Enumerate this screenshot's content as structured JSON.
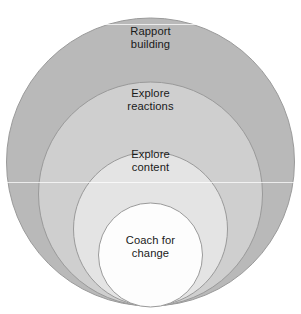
{
  "figure": {
    "kind": "nested-circles-diagram",
    "background_color": "#ffffff",
    "width": 301,
    "height": 314,
    "label_color": "#1a1a1a",
    "stroke_color": "#9a9a9a"
  },
  "circles": [
    {
      "id": "rapport-building",
      "label": "Rapport\nbuilding",
      "label_line1": "Rapport",
      "label_line2": "building",
      "level": 1,
      "fill": "#b9b9b9",
      "stroke": "#9a9a9a",
      "cx": 150.5,
      "cy": 162,
      "r": 144
    },
    {
      "id": "explore-reactions",
      "label": "Explore\nreactions",
      "label_line1": "Explore",
      "label_line2": "reactions",
      "level": 2,
      "fill": "#cfcfcf",
      "stroke": "#9a9a9a",
      "cx": 150.5,
      "cy": 194,
      "r": 112
    },
    {
      "id": "explore-content",
      "label": "Explore\ncontent",
      "label_line1": "Explore",
      "label_line2": "content",
      "level": 3,
      "fill": "#e4e4e4",
      "stroke": "#9a9a9a",
      "cx": 150.5,
      "cy": 229,
      "r": 77
    },
    {
      "id": "coach-for-change",
      "label": "Coach for\nchange",
      "label_line1": "Coach for",
      "label_line2": "change",
      "level": 4,
      "fill": "#fdfdfd",
      "stroke": "#9a9a9a",
      "cx": 150.5,
      "cy": 255,
      "r": 52
    }
  ]
}
